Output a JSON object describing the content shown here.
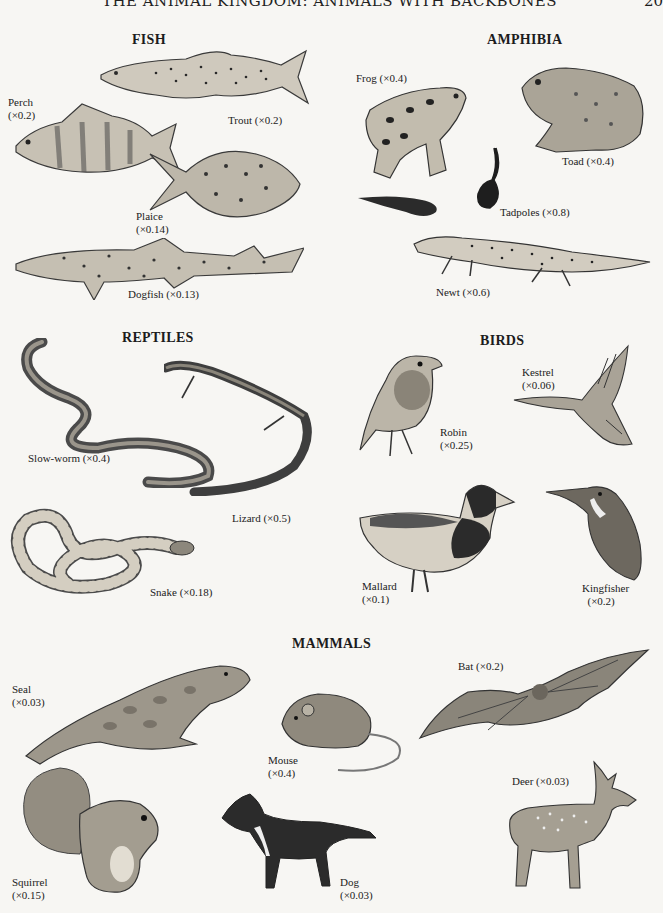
{
  "page": {
    "header": "THE ANIMAL KINGDOM: ANIMALS WITH BACKBONES",
    "page_number": "20"
  },
  "sections": {
    "fish": {
      "title": "FISH",
      "animals": [
        {
          "name": "Trout",
          "scale": "(×0.2)",
          "label": "Trout (×0.2)"
        },
        {
          "name": "Perch",
          "scale": "(×0.2)",
          "label": "Perch\n(×0.2)"
        },
        {
          "name": "Plaice",
          "scale": "(×0.14)",
          "label": "Plaice\n(×0.14)"
        },
        {
          "name": "Dogfish",
          "scale": "(×0.13)",
          "label": "Dogfish (×0.13)"
        }
      ]
    },
    "amphibia": {
      "title": "AMPHIBIA",
      "animals": [
        {
          "name": "Frog",
          "scale": "(×0.4)",
          "label": "Frog (×0.4)"
        },
        {
          "name": "Toad",
          "scale": "(×0.4)",
          "label": "Toad (×0.4)"
        },
        {
          "name": "Tadpoles",
          "scale": "(×0.8)",
          "label": "Tadpoles (×0.8)"
        },
        {
          "name": "Newt",
          "scale": "(×0.6)",
          "label": "Newt (×0.6)"
        }
      ]
    },
    "reptiles": {
      "title": "REPTILES",
      "animals": [
        {
          "name": "Slow-worm",
          "scale": "(×0.4)",
          "label": "Slow-worm (×0.4)"
        },
        {
          "name": "Lizard",
          "scale": "(×0.5)",
          "label": "Lizard (×0.5)"
        },
        {
          "name": "Snake",
          "scale": "(×0.18)",
          "label": "Snake (×0.18)"
        }
      ]
    },
    "birds": {
      "title": "BIRDS",
      "animals": [
        {
          "name": "Robin",
          "scale": "(×0.25)",
          "label": "Robin\n(×0.25)"
        },
        {
          "name": "Kestrel",
          "scale": "(×0.06)",
          "label": "Kestrel\n(×0.06)"
        },
        {
          "name": "Mallard",
          "scale": "(×0.1)",
          "label": "Mallard\n(×0.1)"
        },
        {
          "name": "Kingfisher",
          "scale": "(×0.2)",
          "label": "Kingfisher\n  (×0.2)"
        }
      ]
    },
    "mammals": {
      "title": "MAMMALS",
      "animals": [
        {
          "name": "Seal",
          "scale": "(×0.03)",
          "label": "Seal\n(×0.03)"
        },
        {
          "name": "Mouse",
          "scale": "(×0.4)",
          "label": "Mouse\n(×0.4)"
        },
        {
          "name": "Bat",
          "scale": "(×0.2)",
          "label": "Bat (×0.2)"
        },
        {
          "name": "Deer",
          "scale": "(×0.03)",
          "label": "Deer (×0.03)"
        },
        {
          "name": "Squirrel",
          "scale": "(×0.15)",
          "label": "Squirrel\n(×0.15)"
        },
        {
          "name": "Dog",
          "scale": "(×0.03)",
          "label": "Dog\n(×0.03)"
        }
      ]
    }
  }
}
